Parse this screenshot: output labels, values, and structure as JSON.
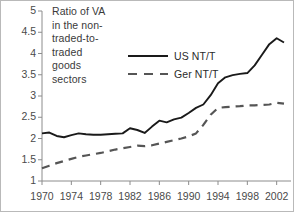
{
  "chart_data": {
    "type": "line",
    "title_lines": [
      "Ratio of VA",
      "in the non-",
      "traded-to-",
      "traded",
      "goods",
      "sectors"
    ],
    "xlabel": "",
    "ylabel": "",
    "xlim": [
      1970,
      2003
    ],
    "ylim": [
      1,
      5
    ],
    "yticks": [
      1,
      1.5,
      2,
      2.5,
      3,
      3.5,
      4,
      4.5,
      5
    ],
    "ytick_labels": [
      "1",
      "1.5",
      "2",
      "2.5",
      "3",
      "3.5",
      "4",
      "4.5",
      "5"
    ],
    "xticks": [
      1970,
      1974,
      1978,
      1982,
      1986,
      1990,
      1994,
      1998,
      2002
    ],
    "xtick_labels": [
      "1970",
      "1974",
      "1978",
      "1982",
      "1986",
      "1990",
      "1994",
      "1998",
      "2002"
    ],
    "grid": false,
    "legend_position": "upper-center",
    "x": [
      1970,
      1971,
      1972,
      1973,
      1974,
      1975,
      1976,
      1977,
      1978,
      1979,
      1980,
      1981,
      1982,
      1983,
      1984,
      1985,
      1986,
      1987,
      1988,
      1989,
      1990,
      1991,
      1992,
      1993,
      1994,
      1995,
      1996,
      1997,
      1998,
      1999,
      2000,
      2001,
      2002,
      2003
    ],
    "series": [
      {
        "name": "US NT/T",
        "label": "US NT/T",
        "style": "solid",
        "color": "#1a1a1a",
        "values": [
          2.12,
          2.14,
          2.06,
          2.03,
          2.08,
          2.12,
          2.1,
          2.09,
          2.09,
          2.1,
          2.11,
          2.12,
          2.24,
          2.2,
          2.13,
          2.28,
          2.42,
          2.38,
          2.45,
          2.49,
          2.6,
          2.72,
          2.8,
          3.02,
          3.3,
          3.44,
          3.49,
          3.52,
          3.54,
          3.72,
          3.97,
          4.22,
          4.36,
          4.26
        ]
      },
      {
        "name": "Ger NT/T",
        "label": "Ger NT/T",
        "style": "dashed",
        "color": "#555555",
        "values": [
          1.3,
          1.36,
          1.42,
          1.47,
          1.52,
          1.57,
          1.6,
          1.63,
          1.66,
          1.7,
          1.74,
          1.77,
          1.8,
          1.83,
          1.82,
          1.84,
          1.88,
          1.92,
          1.96,
          2.0,
          2.05,
          2.12,
          2.32,
          2.56,
          2.72,
          2.74,
          2.75,
          2.76,
          2.78,
          2.78,
          2.79,
          2.8,
          2.84,
          2.82
        ]
      }
    ]
  }
}
